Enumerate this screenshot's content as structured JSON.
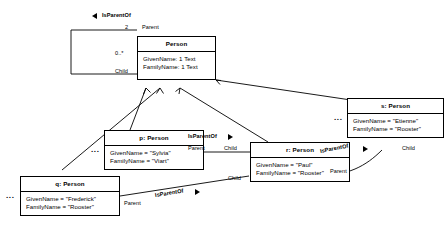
{
  "diagram": {
    "type": "uml-object-diagram",
    "title_association": "IsParentOf",
    "ellipsis": "..."
  },
  "class_node": {
    "name": "Person",
    "attributes": [
      "GivenName: 1 Text",
      "FamilyName: 1 Text"
    ]
  },
  "self_association": {
    "name": "IsParentOf",
    "parent_multiplicity": "2",
    "parent_role": "Parent",
    "child_multiplicity": "0..*",
    "child_role": "Child"
  },
  "objects": [
    {
      "id": "p",
      "title": "p: Person",
      "attributes": [
        "GivenName = \"Sylvia\"",
        "FamilyName = \"Viart\""
      ]
    },
    {
      "id": "r",
      "title": "r: Person",
      "attributes": [
        "GivenName = \"Paul\"",
        "FamilyName = \"Rooster\""
      ]
    },
    {
      "id": "s",
      "title": "s: Person",
      "attributes": [
        "GivenName = \"Etienne\"",
        "FamilyName = \"Rooster\""
      ]
    },
    {
      "id": "q",
      "title": "q: Person",
      "attributes": [
        "GivenName = \"Frederick\"",
        "FamilyName = \"Rooster\""
      ]
    }
  ],
  "links": [
    {
      "name": "IsParentOf",
      "parent_role": "Parent",
      "child_role": "Child",
      "from": "p",
      "to": "r"
    },
    {
      "name": "IsParentOf",
      "parent_role": "Parent",
      "child_role": "Child",
      "from": "q",
      "to": "r"
    },
    {
      "name": "IsParentOf",
      "parent_role": "Parent",
      "child_role": "Child",
      "from": "r",
      "to": "s"
    }
  ]
}
